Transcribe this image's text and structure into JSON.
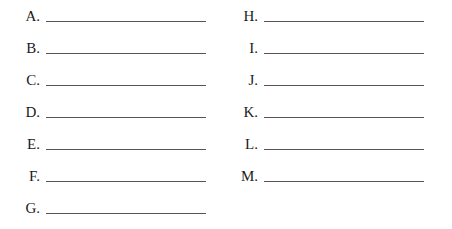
{
  "left_column": [
    {
      "label": "A.",
      "answer": ""
    },
    {
      "label": "B.",
      "answer": ""
    },
    {
      "label": "C.",
      "answer": ""
    },
    {
      "label": "D.",
      "answer": ""
    },
    {
      "label": "E.",
      "answer": ""
    },
    {
      "label": "F.",
      "answer": ""
    },
    {
      "label": "G.",
      "answer": ""
    }
  ],
  "right_column": [
    {
      "label": "H.",
      "answer": ""
    },
    {
      "label": "I.",
      "answer": ""
    },
    {
      "label": "J.",
      "answer": ""
    },
    {
      "label": "K.",
      "answer": ""
    },
    {
      "label": "L.",
      "answer": ""
    },
    {
      "label": "M.",
      "answer": ""
    }
  ]
}
